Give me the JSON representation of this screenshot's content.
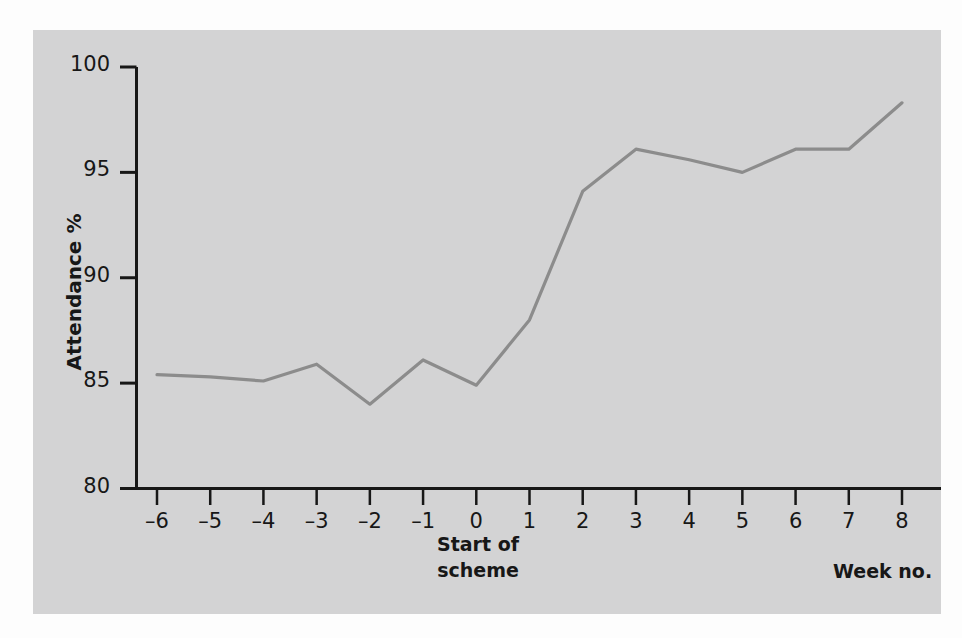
{
  "figure": {
    "panel_color": "#d3d3d4",
    "page_background": "#fdfdfd",
    "axis_color": "#171717",
    "line_color": "#8c8c8c"
  },
  "chart_data": {
    "type": "line",
    "title": "",
    "xlabel": "Week no.",
    "ylabel": "Attendance %",
    "xlim": [
      -6,
      8
    ],
    "ylim": [
      80,
      100
    ],
    "grid": false,
    "legend": "none",
    "x": [
      -6,
      -5,
      -4,
      -3,
      -2,
      -1,
      0,
      1,
      2,
      3,
      4,
      5,
      6,
      7,
      8
    ],
    "xtick_labels": [
      "–6",
      "–5",
      "–4",
      "–3",
      "–2",
      "–1",
      "0",
      "1",
      "2",
      "3",
      "4",
      "5",
      "6",
      "7",
      "8"
    ],
    "ytick_labels": [
      "80",
      "85",
      "90",
      "95",
      "100"
    ],
    "yticks": [
      80,
      85,
      90,
      95,
      100
    ],
    "series": [
      {
        "name": "Attendance %",
        "values": [
          85.4,
          85.3,
          85.1,
          85.9,
          84.0,
          86.1,
          84.9,
          88.0,
          94.1,
          96.1,
          95.6,
          95.0,
          96.1,
          96.1,
          98.3
        ]
      }
    ],
    "annotations": [
      {
        "text": "Start of scheme",
        "line1": "Start of",
        "line2": "scheme",
        "x": 0,
        "position": "below-axis"
      },
      {
        "text": "Week no.",
        "position": "axis-right"
      }
    ]
  }
}
